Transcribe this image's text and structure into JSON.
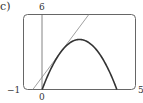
{
  "panel": {
    "label": "c)"
  },
  "chart_data": {
    "type": "line",
    "title": "",
    "xlabel": "",
    "ylabel": "",
    "xlim": [
      -1,
      5
    ],
    "ylim": [
      0,
      6
    ],
    "grid": false,
    "tick_labels": {
      "x_min": "−1",
      "x_zero": "0",
      "x_max": "5",
      "y_max": "6"
    },
    "series": [
      {
        "name": "curve y = 4x − x²",
        "style": "bold",
        "x": [
          0,
          0.5,
          1,
          1.5,
          2,
          2.5,
          3,
          3.5,
          4
        ],
        "y": [
          0,
          1.75,
          3,
          3.75,
          4,
          3.75,
          3,
          1.75,
          0
        ]
      },
      {
        "name": "tangent line y = 2x + 1 at x = 1",
        "style": "thin",
        "x": [
          -0.5,
          2.5
        ],
        "y": [
          0,
          6
        ]
      }
    ],
    "annotations": [
      "viewing rectangle [-1,5] by [0,6]",
      "vertical axis at x = 0"
    ]
  },
  "colors": {
    "frame": "#666666",
    "curve": "#333333",
    "tangent": "#888888",
    "axis": "#666666"
  }
}
